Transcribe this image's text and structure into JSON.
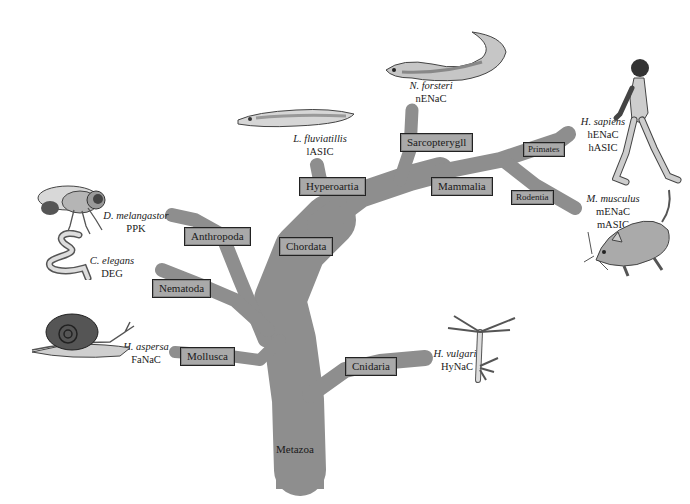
{
  "diagram": {
    "type": "phylogenetic-tree",
    "branch_color": "#8e8e8e",
    "label_box_color": "#a9a9a9",
    "root": "Metazoa",
    "clades": [
      {
        "id": "anthropoda",
        "label": "Anthropoda"
      },
      {
        "id": "nematoda",
        "label": "Nematoda"
      },
      {
        "id": "mollusca",
        "label": "Mollusca"
      },
      {
        "id": "chordata",
        "label": "Chordata"
      },
      {
        "id": "hyperoartia",
        "label": "Hyperoartia"
      },
      {
        "id": "sarcopterygii",
        "label": "Sarcopterygll"
      },
      {
        "id": "mammalia",
        "label": "Mammalia"
      },
      {
        "id": "primates",
        "label": "Primates"
      },
      {
        "id": "rodentia",
        "label": "Rodentia"
      },
      {
        "id": "cnidaria",
        "label": "Cnidaria"
      }
    ],
    "species": [
      {
        "id": "fly",
        "name": "D. melangastor",
        "channels": [
          "PPK"
        ],
        "animal": "fruit-fly"
      },
      {
        "id": "worm",
        "name": "C. elegans",
        "channels": [
          "DEG"
        ],
        "animal": "nematode-worm"
      },
      {
        "id": "snail",
        "name": "H. aspersa",
        "channels": [
          "FaNaC"
        ],
        "animal": "snail"
      },
      {
        "id": "lamprey",
        "name": "L. fluviatillis",
        "channels": [
          "lASIC"
        ],
        "animal": "lamprey"
      },
      {
        "id": "lungfish",
        "name": "N. forsteri",
        "channels": [
          "nENaC"
        ],
        "animal": "lungfish"
      },
      {
        "id": "human",
        "name": "H. sapiens",
        "channels": [
          "hENaC",
          "hASIC"
        ],
        "animal": "human"
      },
      {
        "id": "mouse",
        "name": "M. musculus",
        "channels": [
          "mENaC",
          "mASIC"
        ],
        "animal": "mouse"
      },
      {
        "id": "hydra",
        "name": "H. vulgaris",
        "channels": [
          "HyNaC"
        ],
        "animal": "hydra"
      }
    ]
  }
}
